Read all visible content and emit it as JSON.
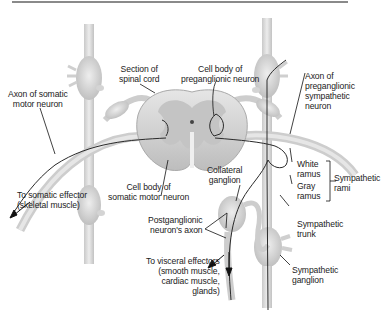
{
  "diagram": {
    "type": "anatomical-illustration",
    "colors": {
      "tissue": "#d9d9d9",
      "tissue_dark": "#b8b8b8",
      "gray_matter": "#c4c4c4",
      "axon_line": "#2a2a2a",
      "rule": "#8a8a8a"
    },
    "labels": {
      "section_spinal_cord": [
        "Section of",
        "spinal cord"
      ],
      "cell_body_preganglionic": [
        "Cell body of",
        "preganglionic neuron"
      ],
      "axon_somatic_motor": [
        "Axon of somatic",
        "motor neuron"
      ],
      "axon_preganglionic_sympathetic": [
        "Axon of",
        "preganglionic",
        "sympathetic",
        "neuron"
      ],
      "white_ramus": [
        "White",
        "ramus"
      ],
      "gray_ramus": [
        "Gray",
        "ramus"
      ],
      "sympathetic_rami": [
        "Sympathetic",
        "rami"
      ],
      "somatic_effector": [
        "To somatic effector",
        "(skeletal muscle)"
      ],
      "cell_body_somatic_motor": [
        "Cell body of",
        "somatic motor neuron"
      ],
      "collateral_ganglion": [
        "Collateral",
        "ganglion"
      ],
      "postganglionic_axon": [
        "Postganglionic",
        "neuron's axon"
      ],
      "sympathetic_trunk": [
        "Sympathetic",
        "trunk"
      ],
      "visceral_effectors": [
        "To visceral effectors",
        "(smooth muscle,",
        "cardiac muscle,",
        "glands)"
      ],
      "sympathetic_ganglion": [
        "Sympathetic",
        "ganglion"
      ]
    }
  }
}
